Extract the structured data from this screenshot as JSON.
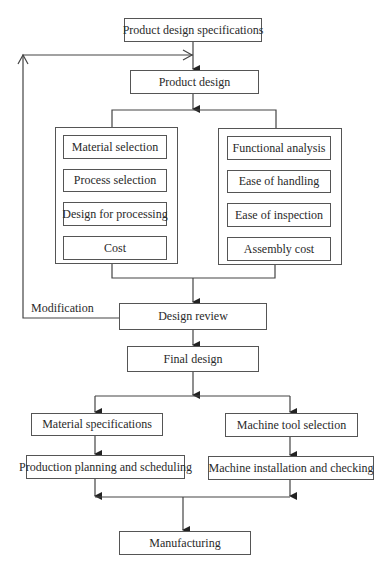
{
  "diagram": {
    "type": "flowchart",
    "nodes": {
      "spec": "Product design specifications",
      "product_design": "Product design",
      "left_group": [
        "Material selection",
        "Process selection",
        "Design for processing",
        "Cost"
      ],
      "right_group": [
        "Functional analysis",
        "Ease of handling",
        "Ease of inspection",
        "Assembly cost"
      ],
      "design_review": "Design review",
      "final_design": "Final design",
      "material_specs": "Material specifications",
      "production_planning": "Production planning and scheduling",
      "machine_tool": "Machine tool selection",
      "machine_install": "Machine installation and checking",
      "manufacturing": "Manufacturing"
    },
    "feedback_label": "Modification",
    "edges": [
      [
        "Product design specifications",
        "Product design"
      ],
      [
        "Product design",
        "left_group"
      ],
      [
        "Product design",
        "right_group"
      ],
      [
        "left_group",
        "Design review"
      ],
      [
        "right_group",
        "Design review"
      ],
      [
        "Design review",
        "Product design",
        "Modification"
      ],
      [
        "Design review",
        "Final design"
      ],
      [
        "Final design",
        "Material specifications"
      ],
      [
        "Final design",
        "Machine tool selection"
      ],
      [
        "Material specifications",
        "Production planning and scheduling"
      ],
      [
        "Machine tool selection",
        "Machine installation and checking"
      ],
      [
        "Production planning and scheduling",
        "Manufacturing"
      ],
      [
        "Machine installation and checking",
        "Manufacturing"
      ]
    ]
  }
}
